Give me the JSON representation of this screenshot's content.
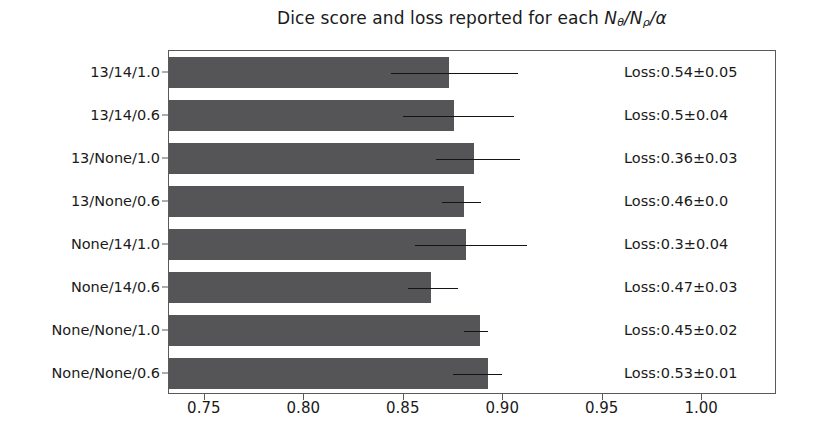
{
  "chart_data": {
    "type": "bar",
    "orientation": "horizontal",
    "title": "Dice score and loss reported for each Nθ/Nρ/α",
    "title_parts": {
      "prefix": "Dice score and loss reported for each ",
      "n1": "N",
      "n1_sub": "θ",
      "sep1": "/",
      "n2": "N",
      "n2_sub": "ρ",
      "sep2": "/",
      "alpha": "α"
    },
    "xlabel": "",
    "ylabel": "",
    "xlim": [
      0.732,
      1.0376
    ],
    "xticks": [
      0.75,
      0.8,
      0.85,
      0.9,
      0.95,
      1.0
    ],
    "xtick_labels": [
      "0.75",
      "0.80",
      "0.85",
      "0.90",
      "0.95",
      "1.00"
    ],
    "grid": false,
    "legend": null,
    "bar_color": "#555558",
    "error_color": "#141414",
    "categories": [
      "13/14/1.0",
      "13/14/0.6",
      "13/None/1.0",
      "13/None/0.6",
      "None/14/1.0",
      "None/14/0.6",
      "None/None/1.0",
      "None/None/0.6"
    ],
    "values": [
      0.8725,
      0.8755,
      0.8855,
      0.8805,
      0.8815,
      0.8635,
      0.8885,
      0.8925
    ],
    "errors_low": [
      0.8435,
      0.8495,
      0.866,
      0.869,
      0.8555,
      0.852,
      0.8805,
      0.8745
    ],
    "errors_high": [
      0.9075,
      0.9055,
      0.9085,
      0.889,
      0.912,
      0.8775,
      0.8925,
      0.8995
    ],
    "annotations": [
      "Loss:0.54±0.05",
      "Loss:0.5±0.04",
      "Loss:0.36±0.03",
      "Loss:0.46±0.0",
      "Loss:0.3±0.04",
      "Loss:0.47±0.03",
      "Loss:0.45±0.02",
      "Loss:0.53±0.01"
    ]
  }
}
